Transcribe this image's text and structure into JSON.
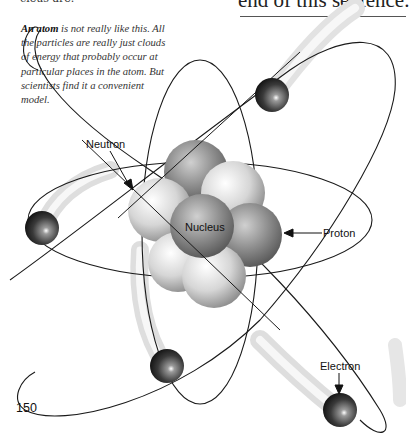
{
  "page": {
    "cropped_text_left": "cleus are.",
    "cropped_text_right": "end of this sentence.",
    "page_number": "150"
  },
  "caption": {
    "bold_lead": "An atom",
    "text": " is not really like this. All the particles are really just clouds of energy that probably occur at particular places in the atom. But scientists find it a convenient model."
  },
  "diagram": {
    "labels": {
      "neutron": "Neutron",
      "nucleus": "Nucleus",
      "proton": "Proton",
      "electron": "Electron"
    },
    "electron_count": 5,
    "nucleus_particle_count": 9
  }
}
